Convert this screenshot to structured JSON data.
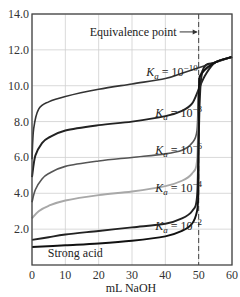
{
  "chart_data": {
    "type": "line",
    "title": "",
    "xlabel": "mL NaOH",
    "ylabel": "pH",
    "xlim": [
      0,
      60
    ],
    "ylim": [
      0,
      14
    ],
    "x_ticks": [
      "0",
      "10",
      "20",
      "30",
      "40",
      "50",
      "60"
    ],
    "y_ticks": [
      "2.0",
      "4.0",
      "6.0",
      "8.0",
      "10.0",
      "12.0",
      "14.0"
    ],
    "grid": true,
    "annotations": [
      {
        "text": "Equivalence point",
        "x": 50,
        "y": 13.0,
        "arrow_to_x": 50
      }
    ],
    "equivalence_line_x": 50,
    "series": [
      {
        "name": "Ka = 10^-10",
        "label_base": "K",
        "label_sub": "a",
        "label_exp": "-10",
        "color": "#333333",
        "x": [
          0,
          0.5,
          2,
          5,
          10,
          20,
          30,
          40,
          45,
          50,
          55,
          60
        ],
        "y": [
          5.9,
          7.6,
          8.7,
          9.1,
          9.4,
          9.8,
          10.1,
          10.4,
          10.7,
          11.0,
          11.3,
          11.6
        ]
      },
      {
        "name": "Ka = 10^-8",
        "label_base": "K",
        "label_sub": "a",
        "label_exp": "-8",
        "color": "#222222",
        "x": [
          0,
          1,
          3,
          5,
          10,
          20,
          30,
          40,
          45,
          48,
          50,
          52,
          55,
          60
        ],
        "y": [
          4.9,
          6.1,
          6.8,
          7.1,
          7.5,
          7.8,
          8.0,
          8.3,
          8.6,
          9.0,
          9.8,
          10.6,
          11.3,
          11.6
        ]
      },
      {
        "name": "Ka = 10^-6",
        "label_base": "K",
        "label_sub": "a",
        "label_exp": "-6",
        "color": "#555555",
        "x": [
          0,
          1,
          3,
          5,
          10,
          20,
          30,
          40,
          45,
          48,
          49.5,
          50,
          51,
          55,
          60
        ],
        "y": [
          3.5,
          4.2,
          4.8,
          5.1,
          5.5,
          5.8,
          6.0,
          6.2,
          6.4,
          6.8,
          7.5,
          9.8,
          10.8,
          11.3,
          11.6
        ]
      },
      {
        "name": "Ka = 10^-4",
        "label_base": "K",
        "label_sub": "a",
        "label_exp": "-4",
        "color": "#a8a8a8",
        "x": [
          0,
          2,
          5,
          10,
          20,
          30,
          40,
          45,
          48,
          49.5,
          50,
          51,
          55,
          60
        ],
        "y": [
          2.6,
          3.0,
          3.3,
          3.6,
          3.9,
          4.1,
          4.4,
          4.7,
          5.1,
          5.8,
          8.5,
          10.7,
          11.3,
          11.6
        ]
      },
      {
        "name": "Ka = 10^-2",
        "label_base": "K",
        "label_sub": "a",
        "label_exp": "-2",
        "color": "#222222",
        "x": [
          0,
          5,
          10,
          20,
          30,
          40,
          45,
          48,
          49.5,
          50,
          51,
          55,
          60
        ],
        "y": [
          1.4,
          1.55,
          1.7,
          1.9,
          2.1,
          2.3,
          2.6,
          3.0,
          3.8,
          7.0,
          10.7,
          11.3,
          11.6
        ]
      },
      {
        "name": "Strong acid",
        "label": "Strong acid",
        "color": "#111111",
        "x": [
          0,
          10,
          20,
          30,
          40,
          45,
          48,
          49.5,
          49.9,
          50,
          50.1,
          51,
          55,
          60
        ],
        "y": [
          1.0,
          1.1,
          1.2,
          1.35,
          1.6,
          1.9,
          2.3,
          3.0,
          4.0,
          7.0,
          10.0,
          10.7,
          11.3,
          11.6
        ]
      }
    ],
    "series_labels_pos": [
      {
        "x": 42,
        "y": 10.55
      },
      {
        "x": 44,
        "y": 8.25
      },
      {
        "x": 44,
        "y": 6.2
      },
      {
        "x": 44,
        "y": 4.05
      },
      {
        "x": 44,
        "y": 1.95
      },
      {
        "x": 13,
        "y": 0.45
      }
    ]
  },
  "layout": {
    "plot": {
      "left": 32,
      "top": 14,
      "right": 232,
      "bottom": 265
    },
    "xlabel_pos": {
      "x": 131,
      "y": 292
    }
  }
}
